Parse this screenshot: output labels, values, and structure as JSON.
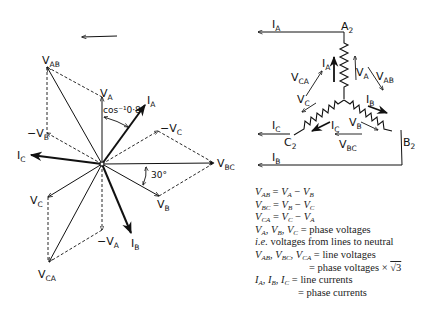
{
  "phasor_diagram": {
    "rotation_arrow": "counter-clockwise",
    "labels": {
      "VAB": "V",
      "VAB_sub": "AB",
      "VA": "V",
      "VA_sub": "A",
      "IA": "I",
      "IA_sub": "A",
      "neg_VB": "−V",
      "neg_VB_sub": "B",
      "neg_VC": "−V",
      "neg_VC_sub": "C",
      "IC": "I",
      "IC_sub": "C",
      "VBC": "V",
      "VBC_sub": "BC",
      "VB": "V",
      "VB_sub": "B",
      "VC": "V",
      "VC_sub": "C",
      "neg_VA": "−V",
      "neg_VA_sub": "A",
      "IB": "I",
      "IB_sub": "B",
      "VCA": "V",
      "VCA_sub": "CA"
    },
    "angle_labels": {
      "power_factor": "cos⁻¹0·8",
      "thirty": "30°"
    }
  },
  "star_circuit": {
    "terminals": {
      "A2": "A",
      "A2_sub": "2",
      "B2": "B",
      "B2_sub": "2",
      "C2": "C",
      "C2_sub": "2"
    },
    "labels": {
      "IA_line": "I",
      "IA_line_sub": "A",
      "IA_phase": "I",
      "IA_phase_sub": "A",
      "VA": "V",
      "VA_sub": "A",
      "VAB": "V",
      "VAB_sub": "AB",
      "VCA": "V",
      "VCA_sub": "CA",
      "VC": "V",
      "VC_sub": "C",
      "IB_phase": "I",
      "IB_phase_sub": "B",
      "IC_line": "I",
      "IC_line_sub": "C",
      "IC_phase": "I",
      "IC_phase_sub": "C",
      "VB": "V",
      "VB_sub": "B",
      "VBC": "V",
      "VBC_sub": "BC",
      "IB_line": "I",
      "IB_line_sub": "B"
    }
  },
  "equations": [
    "V_AB = V_A − V_B",
    "V_BC = V_B − V_C",
    "V_CA = V_C − V_A",
    "V_A, V_B, V_C = phase voltages",
    "i.e. voltages from lines to neutral",
    "V_AB, V_BC, V_CA = line voltages",
    "= phase voltages × √3",
    "I_A, I_B, I_C = line currents",
    "= phase currents"
  ],
  "eq_text": {
    "e1_rhs": "= ",
    "minus": " − ",
    "phase_voltages": " = phase voltages",
    "ie": "i.e.",
    "ie_rest": " voltages from lines to neutral",
    "line_voltages": " = line voltages",
    "times_root3": "= phase voltages × ",
    "root": "√3",
    "line_currents": " = line currents",
    "phase_currents": "= phase currents",
    "comma": ", "
  }
}
